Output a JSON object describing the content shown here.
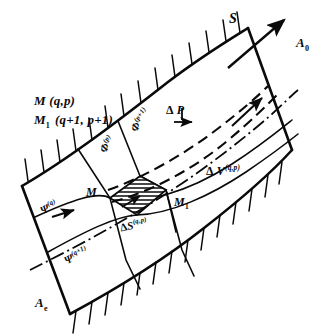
{
  "figure": {
    "title_labels": {
      "point_M": "M (q,p)",
      "point_M1_symbol": "M",
      "point_M1_sub": "1",
      "point_M1_rest": "(q+1, p+1)"
    },
    "stream_arrow": {
      "label": "S",
      "name": "stream-direction-arrow"
    },
    "boundaries": {
      "inlet_label_base": "A",
      "inlet_label_sub": "e",
      "outlet_label_base": "A",
      "outlet_label_sub": "0"
    },
    "surfaces": {
      "phi_p": {
        "base": "Φ",
        "sup": "(p)"
      },
      "phi_p1": {
        "base": "Φ",
        "sup": "(p+1)"
      },
      "psi_q": {
        "base": "Ψ",
        "sup": "(q)"
      },
      "psi_q1": {
        "base": "Ψ",
        "sup": "(q+1)"
      }
    },
    "nodes": {
      "M": "M",
      "M1_base": "M",
      "M1_sub": "1"
    },
    "quantities": {
      "delta_P": {
        "prefix": "Δ",
        "symbol": "P"
      },
      "delta_V": {
        "prefix": "Δ",
        "symbol": "V",
        "sup": "(q,p)"
      },
      "delta_S": {
        "prefix": "Δ",
        "symbol": "S",
        "sup": "(q,p)"
      }
    },
    "colors": {
      "ink": "#0a0a0a",
      "paper": "#ffffff"
    }
  }
}
